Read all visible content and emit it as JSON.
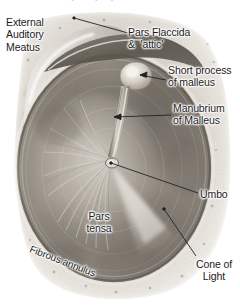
{
  "figure": {
    "title": "The right tympanic membrane",
    "width": 240,
    "height": 307,
    "background_color": "#ffffff",
    "image_style": "sepia-grayscale-photograph"
  },
  "labels": {
    "external_auditory_meatus": "External\nAuditory\nMeatus",
    "pars_flaccida": "Pars Flaccida\n&  'attic'",
    "short_process_of_malleus": "Short process\nof malleus",
    "manubrium_of_malleus": "Manubrium\nof Malleus",
    "umbo": "Umbo",
    "cone_of_light": "Cone of\nLight",
    "pars_tensa": "Pars\ntensa",
    "fibrous_annulus": "Fibrous annulus"
  },
  "colors": {
    "label_text": "#1c1c1c",
    "leader_line": "#222222",
    "membrane_mid": "#9d968c",
    "membrane_dark": "#6f6a63",
    "membrane_light": "#d9d4cb",
    "cone_highlight": "#eae6de",
    "annulus": "#7d756b",
    "canal_wall": "#c9c4bb"
  },
  "leaders": [
    {
      "name": "pars-flaccida-leader",
      "x1": 128,
      "y1": 33,
      "x2": 74,
      "y2": 18
    },
    {
      "name": "short-process-leader",
      "x1": 166,
      "y1": 80,
      "x2": 140,
      "y2": 75
    },
    {
      "name": "manubrium-leader",
      "x1": 171,
      "y1": 115,
      "x2": 114,
      "y2": 117
    },
    {
      "name": "umbo-leader",
      "x1": 198,
      "y1": 193,
      "x2": 111,
      "y2": 163
    },
    {
      "name": "cone-of-light-leader",
      "x1": 196,
      "y1": 256,
      "x2": 164,
      "y2": 209
    }
  ]
}
